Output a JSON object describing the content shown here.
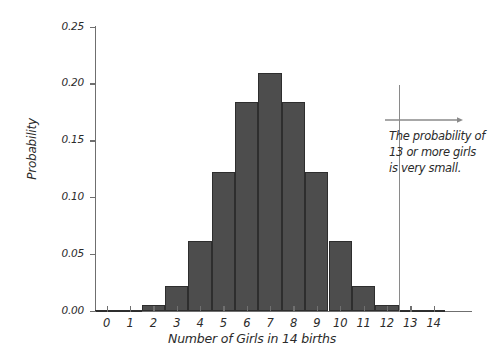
{
  "chart_data": {
    "type": "bar",
    "title": "",
    "subtitle": "",
    "xlabel": "Number of Girls in 14 births",
    "ylabel": "Probability",
    "categories": [
      "0",
      "1",
      "2",
      "3",
      "4",
      "5",
      "6",
      "7",
      "8",
      "9",
      "10",
      "11",
      "12",
      "13",
      "14"
    ],
    "values": [
      0.0001,
      0.0009,
      0.0056,
      0.0222,
      0.0611,
      0.1222,
      0.1833,
      0.2095,
      0.1833,
      0.1222,
      0.0611,
      0.0222,
      0.0056,
      0.0009,
      0.0001
    ],
    "xlim": [
      -0.5,
      14.5
    ],
    "ylim": [
      0.0,
      0.25
    ],
    "ytick_labels": [
      "0.00",
      "0.05",
      "0.10",
      "0.15",
      "0.20",
      "0.25"
    ],
    "ytick_values": [
      0.0,
      0.05,
      0.1,
      0.15,
      0.2,
      0.25
    ],
    "xtick_labels": [
      "0",
      "1",
      "2",
      "3",
      "4",
      "5",
      "6",
      "7",
      "8",
      "9",
      "10",
      "11",
      "12",
      "13",
      "14"
    ],
    "grid": false,
    "legend": null,
    "bar_color": "#4d4d4d",
    "bar_edge_color": "#2e2e2e",
    "axis_color": "#6f6f6f",
    "annotation": {
      "cutoff_x": 12.5,
      "cutoff_color": "#8a8a8a",
      "arrow_direction": "right",
      "text_lines": [
        "The probability of",
        "13 or more girls",
        "is very small."
      ]
    }
  }
}
